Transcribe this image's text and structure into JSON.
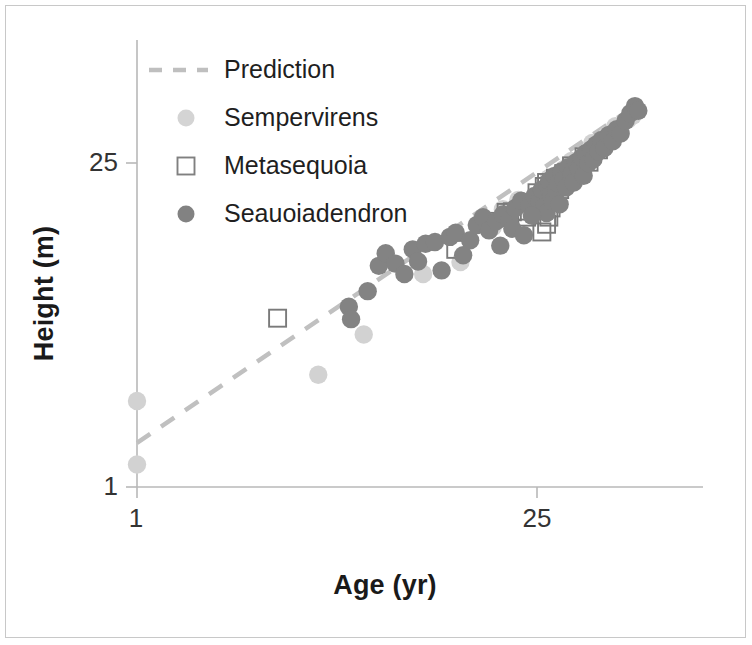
{
  "axes": {
    "xlabel": "Age (yr)",
    "ylabel": "Height (m)",
    "xticks": [
      "1",
      "25"
    ],
    "yticks": [
      "25",
      "1"
    ]
  },
  "legend": {
    "entries": [
      {
        "label": "Prediction",
        "marker": "dashed-line",
        "color": "#bfbfbf"
      },
      {
        "label": "Sempervirens",
        "marker": "circle",
        "color": "#d4d4d4"
      },
      {
        "label": "Metasequoia",
        "marker": "open-square",
        "color": "#808080"
      },
      {
        "label": "Seauoiadendron",
        "marker": "circle",
        "color": "#828282"
      }
    ]
  },
  "colors": {
    "sempervirens": "#d2d2d2",
    "metasequoia_stroke": "#7a7a7a",
    "sequoiadendron": "#838383",
    "prediction_line": "#c0c0c0",
    "axis_line": "#b8b8b8",
    "frame": "#c8c8c8",
    "text": "#1a1a1a"
  },
  "chart_data": {
    "type": "scatter",
    "title": "",
    "xlabel": "Age (yr)",
    "ylabel": "Height (m)",
    "xscale": "log",
    "yscale": "log",
    "xlim": [
      1,
      60
    ],
    "ylim": [
      1,
      60
    ],
    "xtick_values": [
      1,
      25
    ],
    "ytick_values": [
      1,
      25
    ],
    "grid": false,
    "legend_position": "upper-left",
    "series": [
      {
        "name": "Prediction",
        "type": "line",
        "style": "dashed",
        "color": "#c0c0c0",
        "points": [
          [
            1.0,
            1.55
          ],
          [
            58.0,
            46.0
          ]
        ]
      },
      {
        "name": "Sempervirens",
        "type": "scatter",
        "marker": "circle",
        "color": "#d2d2d2",
        "points": [
          [
            1.0,
            2.35
          ],
          [
            1.0,
            1.25
          ],
          [
            4.3,
            3.05
          ],
          [
            6.2,
            4.55
          ],
          [
            10.0,
            8.3
          ],
          [
            13.5,
            9.35
          ],
          [
            17.5,
            13.2
          ],
          [
            19.0,
            15.8
          ],
          [
            21.5,
            17.3
          ],
          [
            23.0,
            16.2
          ],
          [
            26.0,
            19.0
          ],
          [
            27.5,
            21.5
          ],
          [
            29.0,
            18.4
          ],
          [
            31.0,
            23.5
          ],
          [
            33.0,
            25.5
          ],
          [
            35.0,
            22.0
          ],
          [
            37.0,
            27.0
          ],
          [
            39.0,
            30.5
          ],
          [
            41.0,
            29.0
          ],
          [
            44.0,
            33.0
          ],
          [
            47.0,
            36.0
          ],
          [
            49.0,
            34.0
          ],
          [
            52.0,
            38.5
          ],
          [
            54.0,
            40.0
          ]
        ]
      },
      {
        "name": "Metasequoia",
        "type": "scatter",
        "marker": "open-square",
        "color": "#7a7a7a",
        "points": [
          [
            3.1,
            5.35
          ],
          [
            13.0,
            10.6
          ],
          [
            16.5,
            14.0
          ],
          [
            19.5,
            15.3
          ],
          [
            20.5,
            15.4
          ],
          [
            21.5,
            15.5
          ],
          [
            23.0,
            14.6
          ],
          [
            25.0,
            18.6
          ],
          [
            26.0,
            17.2
          ],
          [
            26.5,
            19.8
          ],
          [
            27.0,
            20.6
          ],
          [
            27.0,
            13.6
          ],
          [
            27.5,
            14.6
          ],
          [
            28.0,
            16.0
          ],
          [
            28.5,
            17.6
          ],
          [
            29.0,
            21.5
          ],
          [
            30.0,
            19.2
          ],
          [
            31.0,
            22.5
          ],
          [
            33.0,
            24.3
          ],
          [
            35.0,
            23.0
          ],
          [
            36.5,
            26.6
          ],
          [
            38.0,
            25.2
          ],
          [
            41.0,
            28.5
          ],
          [
            26.0,
            12.6
          ]
        ]
      },
      {
        "name": "Seauoiadendron",
        "type": "scatter",
        "marker": "circle",
        "color": "#838383",
        "points": [
          [
            5.5,
            6.0
          ],
          [
            5.6,
            5.3
          ],
          [
            6.4,
            7.0
          ],
          [
            7.0,
            9.0
          ],
          [
            7.4,
            10.2
          ],
          [
            8.0,
            9.2
          ],
          [
            8.6,
            8.3
          ],
          [
            9.2,
            10.6
          ],
          [
            9.6,
            9.4
          ],
          [
            10.2,
            11.2
          ],
          [
            11.0,
            11.4
          ],
          [
            11.6,
            8.6
          ],
          [
            12.4,
            12.0
          ],
          [
            13.0,
            12.5
          ],
          [
            13.8,
            10.0
          ],
          [
            14.6,
            11.6
          ],
          [
            15.4,
            13.5
          ],
          [
            16.2,
            14.6
          ],
          [
            17.0,
            12.8
          ],
          [
            18.0,
            14.0
          ],
          [
            19.0,
            15.0
          ],
          [
            20.0,
            14.2
          ],
          [
            21.0,
            16.0
          ],
          [
            22.0,
            17.2
          ],
          [
            23.5,
            16.4
          ],
          [
            24.5,
            18.0
          ],
          [
            25.5,
            17.0
          ],
          [
            26.0,
            19.2
          ],
          [
            26.5,
            16.2
          ],
          [
            27.0,
            15.2
          ],
          [
            27.2,
            20.0
          ],
          [
            27.6,
            21.0
          ],
          [
            28.0,
            18.2
          ],
          [
            28.4,
            17.0
          ],
          [
            28.8,
            22.0
          ],
          [
            29.2,
            19.0
          ],
          [
            29.6,
            20.4
          ],
          [
            30.0,
            16.6
          ],
          [
            30.4,
            23.0
          ],
          [
            31.0,
            21.2
          ],
          [
            31.6,
            19.6
          ],
          [
            32.2,
            24.0
          ],
          [
            33.0,
            22.4
          ],
          [
            33.6,
            20.6
          ],
          [
            34.2,
            25.2
          ],
          [
            35.0,
            23.6
          ],
          [
            35.8,
            26.4
          ],
          [
            36.4,
            22.0
          ],
          [
            37.0,
            27.6
          ],
          [
            37.8,
            25.0
          ],
          [
            38.6,
            28.6
          ],
          [
            39.4,
            26.0
          ],
          [
            40.2,
            30.0
          ],
          [
            41.0,
            28.0
          ],
          [
            42.0,
            31.4
          ],
          [
            43.0,
            29.0
          ],
          [
            44.5,
            33.0
          ],
          [
            46.0,
            31.0
          ],
          [
            47.5,
            35.0
          ],
          [
            49.0,
            33.5
          ],
          [
            51.0,
            38.0
          ],
          [
            53.0,
            41.0
          ],
          [
            55.0,
            44.0
          ],
          [
            56.5,
            42.0
          ],
          [
            20.5,
            13.0
          ],
          [
            22.5,
            12.2
          ],
          [
            24.0,
            14.8
          ],
          [
            18.6,
            11.0
          ]
        ]
      }
    ]
  }
}
